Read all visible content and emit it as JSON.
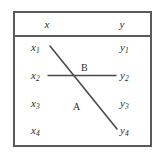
{
  "figure": {
    "type": "bipartite-matching-diagram",
    "columns": [
      {
        "id": "x",
        "header": "x"
      },
      {
        "id": "y",
        "header": "y"
      }
    ],
    "left_nodes": [
      {
        "id": "x1",
        "base": "x",
        "sub": "1"
      },
      {
        "id": "x2",
        "base": "x",
        "sub": "2"
      },
      {
        "id": "x3",
        "base": "x",
        "sub": "3"
      },
      {
        "id": "x4",
        "base": "x",
        "sub": "4"
      }
    ],
    "right_nodes": [
      {
        "id": "y1",
        "base": "y",
        "sub": "1"
      },
      {
        "id": "y2",
        "base": "y",
        "sub": "2"
      },
      {
        "id": "y3",
        "base": "y",
        "sub": "3"
      },
      {
        "id": "y4",
        "base": "y",
        "sub": "4"
      }
    ],
    "edges": [
      {
        "id": "edge-A",
        "label": "A",
        "from": "x1",
        "to": "y4",
        "orientation": "diagonal"
      },
      {
        "id": "edge-B",
        "label": "B",
        "from": "x2",
        "to": "y2",
        "orientation": "horizontal"
      }
    ],
    "colors": {
      "border": "#5a5a5a",
      "line": "#4a4a4a",
      "text": "#2b2b2b",
      "background": "#ffffff"
    }
  }
}
